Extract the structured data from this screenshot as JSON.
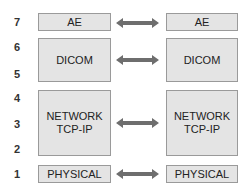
{
  "layer_numbers": [
    "7",
    "6",
    "5",
    "4",
    "3",
    "2",
    "1"
  ],
  "left_stack": {
    "ae": "AE",
    "dicom": "DICOM",
    "network": [
      "NETWORK",
      "TCP-IP"
    ],
    "physical": "PHYSICAL"
  },
  "right_stack": {
    "ae": "AE",
    "dicom": "DICOM",
    "network": [
      "NETWORK",
      "TCP-IP"
    ],
    "physical": "PHYSICAL"
  },
  "arrows": [
    "double-arrow-icon",
    "double-arrow-icon",
    "double-arrow-icon",
    "double-arrow-icon"
  ],
  "colors": {
    "box_fill": "#e4e4e4",
    "box_border": "#9a9a9a",
    "arrow": "#6e6e6e",
    "text": "#222222"
  }
}
